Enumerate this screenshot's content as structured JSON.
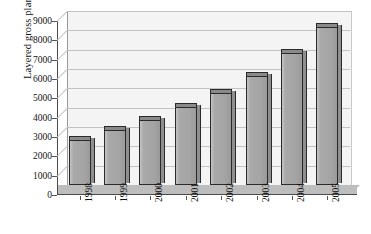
{
  "chart_data": {
    "type": "bar",
    "title": "",
    "subtitle": "",
    "xlabel": "",
    "ylabel": "Layered gross plant (000s)",
    "categories": [
      "1998",
      "1999",
      "2000",
      "2001",
      "2002",
      "2003",
      "2004",
      "2005"
    ],
    "values": [
      2400,
      2900,
      3440,
      4080,
      4820,
      5700,
      6880,
      8210
    ],
    "series": [
      {
        "name": "Layered gross plant",
        "values": [
          2400,
          2900,
          3440,
          4080,
          4820,
          5700,
          6880,
          8210
        ]
      }
    ],
    "ylim": [
      0,
      9000
    ],
    "ytick_labels": [
      "0",
      "1000",
      "2000",
      "3000",
      "4000",
      "5000",
      "6000",
      "7000",
      "8000",
      "9000"
    ],
    "ytick_values": [
      0,
      1000,
      2000,
      3000,
      4000,
      5000,
      6000,
      7000,
      8000,
      9000
    ],
    "grid": true,
    "grid_axis": "y",
    "legend": false,
    "legend_position": "none",
    "style": "3d",
    "colors": {
      "bar_face": "#a8a8a8",
      "bar_top": "#8a8a8a",
      "bar_outline": "#2a2a2a",
      "plot_background": "#f4f4f4",
      "floor": "#bdbdbd",
      "gridline": "#c2c2c2",
      "axis": "#4a4a4a",
      "text": "#111111"
    },
    "annotations": []
  }
}
